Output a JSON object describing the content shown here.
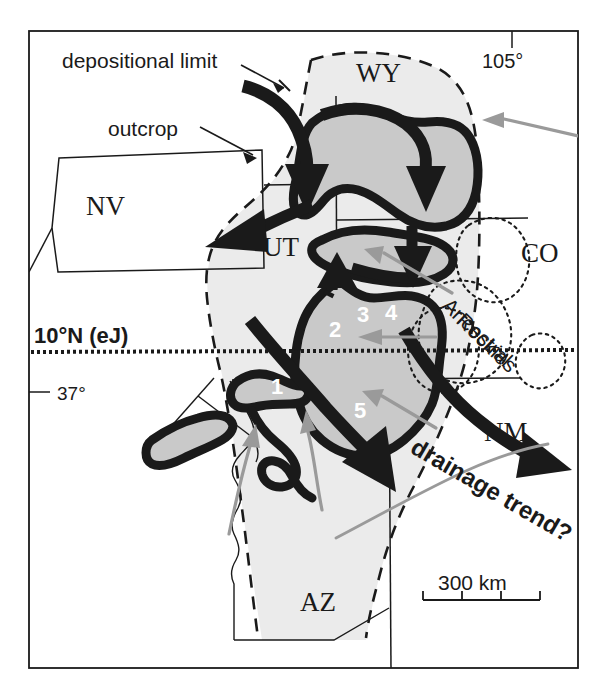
{
  "figure": {
    "type": "paleogeographic-map",
    "region": "Colorado Plateau / Rocky Mountain region, western United States",
    "frame": {
      "stroke": "#1a1a1a"
    }
  },
  "annotations": {
    "depositional_limit": "depositional limit",
    "outcrop": "outcrop",
    "drainage_trend": "drainage trend?",
    "ancestral_rockies": "Ancestral Rockies"
  },
  "state_labels": [
    {
      "id": "wy",
      "text": "WY",
      "x": 375,
      "y": 78
    },
    {
      "id": "nv",
      "text": "NV",
      "x": 105,
      "y": 205
    },
    {
      "id": "ut",
      "text": "UT",
      "x": 287,
      "y": 252
    },
    {
      "id": "co",
      "text": "CO",
      "x": 545,
      "y": 253
    },
    {
      "id": "nm",
      "text": "NM",
      "x": 505,
      "y": 433
    },
    {
      "id": "az",
      "text": "AZ",
      "x": 320,
      "y": 602
    }
  ],
  "graticule_labels": [
    {
      "id": "lon-105",
      "text": "105°",
      "x": 508,
      "y": 62
    },
    {
      "id": "paleolat",
      "text": "10°N (eJ)",
      "x": 34,
      "y": 340
    },
    {
      "id": "lat-37",
      "text": "37°",
      "x": 68,
      "y": 392
    }
  ],
  "numbered_features": [
    {
      "id": "feature-1",
      "label": "1",
      "x": 276,
      "y": 387
    },
    {
      "id": "feature-2",
      "label": "2",
      "x": 335,
      "y": 329
    },
    {
      "id": "feature-3",
      "label": "3",
      "x": 363,
      "y": 315
    },
    {
      "id": "feature-4",
      "label": "4",
      "x": 391,
      "y": 313
    },
    {
      "id": "feature-5",
      "label": "5",
      "x": 360,
      "y": 410
    }
  ],
  "scale_bar": {
    "label": "300 km",
    "x": 435,
    "y": 578,
    "ticks": 4,
    "segments": 3,
    "bar_left": 423,
    "bar_right": 540,
    "bar_y": 600
  },
  "colors": {
    "ink": "#1a1a1a",
    "deposit_fill": "#ebebeb",
    "basin_fill": "#c9c9c9",
    "leader_gray": "#9a9a9a",
    "white": "#ffffff"
  },
  "legend_semantics": {
    "thick_black_arrow": "inferred sediment transport / drainage direction",
    "dashed_line": "depositional limit",
    "thin_solid_line": "outcrop boundary",
    "dotted_line": "Ancestral Rockies uplift outline",
    "dotted_horizontal": "paleolatitude 10°N (early Jurassic)",
    "gray_arrow": "annotation leader"
  }
}
